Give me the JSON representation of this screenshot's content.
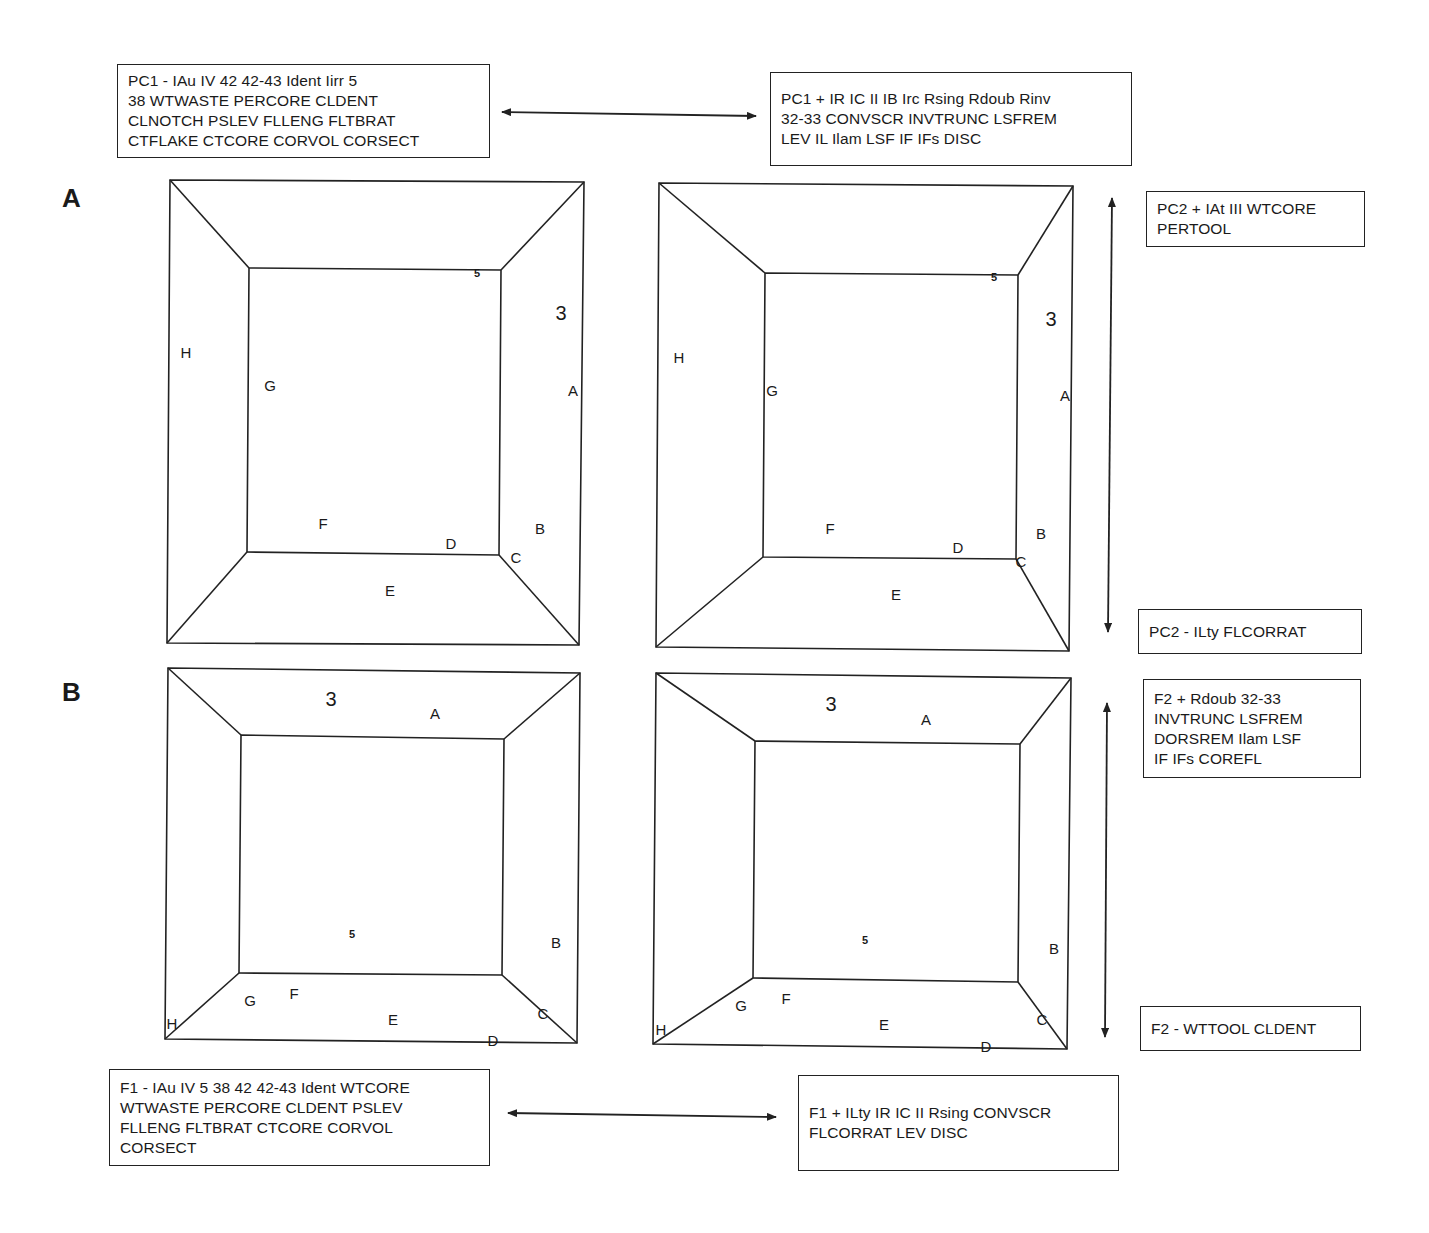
{
  "panels": [
    {
      "id": "A",
      "label": "A",
      "x": 62,
      "y": 198
    },
    {
      "id": "B",
      "label": "B",
      "x": 62,
      "y": 692
    }
  ],
  "text_boxes": [
    {
      "id": "pc1-minus",
      "x": 117,
      "y": 64,
      "w": 373,
      "h": 94,
      "lines": [
        "PC1 - IAu IV 42 42-43 Ident Iirr 5",
        "38 WTWASTE PERCORE CLDENT",
        "CLNOTCH PSLEV FLLENG FLTBRAT",
        "CTFLAKE CTCORE CORVOL CORSECT"
      ]
    },
    {
      "id": "pc1-plus",
      "x": 770,
      "y": 72,
      "w": 362,
      "h": 94,
      "lines": [
        "PC1 + IR IC II IB Irc Rsing Rdoub Rinv",
        "32-33 CONVSCR INVTRUNC LSFREM",
        "LEV IL Ilam LSF IF IFs DISC"
      ]
    },
    {
      "id": "pc2-plus",
      "x": 1146,
      "y": 191,
      "w": 219,
      "h": 56,
      "lines": [
        "PC2 + IAt III WTCORE",
        "PERTOOL"
      ]
    },
    {
      "id": "pc2-minus",
      "x": 1138,
      "y": 609,
      "w": 224,
      "h": 45,
      "lines": [
        "PC2 - ILty FLCORRAT"
      ]
    },
    {
      "id": "f2-plus",
      "x": 1143,
      "y": 679,
      "w": 218,
      "h": 99,
      "lines": [
        "F2 + Rdoub 32-33",
        "INVTRUNC LSFREM",
        "DORSREM Ilam LSF",
        "IF IFs COREFL"
      ]
    },
    {
      "id": "f2-minus",
      "x": 1140,
      "y": 1006,
      "w": 221,
      "h": 45,
      "lines": [
        "F2 - WTTOOL CLDENT"
      ]
    },
    {
      "id": "f1-minus",
      "x": 109,
      "y": 1069,
      "w": 381,
      "h": 97,
      "lines": [
        "F1 - IAu IV 5 38 42 42-43 Ident WTCORE",
        "WTWASTE PERCORE CLDENT PSLEV",
        "FLLENG FLTBRAT CTCORE CORVOL",
        "CORSECT"
      ]
    },
    {
      "id": "f1-plus",
      "x": 798,
      "y": 1075,
      "w": 321,
      "h": 96,
      "lines": [
        "F1 + ILty IR IC II Rsing CONVSCR",
        "FLCORRAT LEV DISC"
      ]
    }
  ],
  "arrows": [
    {
      "id": "pc1-axis",
      "x1": 502,
      "y1": 112,
      "x2": 756,
      "y2": 116
    },
    {
      "id": "pc2-axis",
      "x1": 1112,
      "y1": 198,
      "x2": 1108,
      "y2": 632
    },
    {
      "id": "f2-axis",
      "x1": 1107,
      "y1": 703,
      "x2": 1105,
      "y2": 1037
    },
    {
      "id": "f1-axis",
      "x1": 508,
      "y1": 1113,
      "x2": 776,
      "y2": 1117
    }
  ],
  "frames": [
    {
      "id": "A-left",
      "outer": [
        [
          170,
          180
        ],
        [
          584,
          182
        ],
        [
          579,
          645
        ],
        [
          167,
          643
        ]
      ],
      "inner": [
        [
          249,
          268
        ],
        [
          501,
          270
        ],
        [
          499,
          555
        ],
        [
          247,
          552
        ]
      ],
      "labels": [
        {
          "t": "5",
          "x": 477,
          "y": 273,
          "cls": "small"
        },
        {
          "t": "3",
          "x": 561,
          "y": 313,
          "cls": "big"
        },
        {
          "t": "H",
          "x": 186,
          "y": 352,
          "cls": ""
        },
        {
          "t": "G",
          "x": 270,
          "y": 385,
          "cls": ""
        },
        {
          "t": "A",
          "x": 573,
          "y": 390,
          "cls": ""
        },
        {
          "t": "F",
          "x": 323,
          "y": 523,
          "cls": ""
        },
        {
          "t": "B",
          "x": 540,
          "y": 528,
          "cls": ""
        },
        {
          "t": "D",
          "x": 451,
          "y": 543,
          "cls": ""
        },
        {
          "t": "C",
          "x": 516,
          "y": 557,
          "cls": ""
        },
        {
          "t": "E",
          "x": 390,
          "y": 590,
          "cls": ""
        }
      ]
    },
    {
      "id": "A-right",
      "outer": [
        [
          659,
          183
        ],
        [
          1073,
          186
        ],
        [
          1069,
          651
        ],
        [
          656,
          647
        ]
      ],
      "inner": [
        [
          765,
          273
        ],
        [
          1018,
          275
        ],
        [
          1016,
          559
        ],
        [
          763,
          557
        ]
      ],
      "labels": [
        {
          "t": "5",
          "x": 994,
          "y": 277,
          "cls": "small"
        },
        {
          "t": "3",
          "x": 1051,
          "y": 319,
          "cls": "big"
        },
        {
          "t": "H",
          "x": 679,
          "y": 357,
          "cls": ""
        },
        {
          "t": "G",
          "x": 772,
          "y": 390,
          "cls": ""
        },
        {
          "t": "A",
          "x": 1065,
          "y": 395,
          "cls": ""
        },
        {
          "t": "F",
          "x": 830,
          "y": 528,
          "cls": ""
        },
        {
          "t": "B",
          "x": 1041,
          "y": 533,
          "cls": ""
        },
        {
          "t": "D",
          "x": 958,
          "y": 547,
          "cls": ""
        },
        {
          "t": "C",
          "x": 1021,
          "y": 561,
          "cls": ""
        },
        {
          "t": "E",
          "x": 896,
          "y": 594,
          "cls": ""
        }
      ]
    },
    {
      "id": "B-left",
      "outer": [
        [
          168,
          668
        ],
        [
          580,
          673
        ],
        [
          577,
          1043
        ],
        [
          165,
          1039
        ]
      ],
      "inner": [
        [
          241,
          735
        ],
        [
          504,
          739
        ],
        [
          502,
          975
        ],
        [
          239,
          973
        ]
      ],
      "labels": [
        {
          "t": "3",
          "x": 331,
          "y": 699,
          "cls": "big"
        },
        {
          "t": "A",
          "x": 435,
          "y": 713,
          "cls": ""
        },
        {
          "t": "5",
          "x": 352,
          "y": 934,
          "cls": "small"
        },
        {
          "t": "B",
          "x": 556,
          "y": 942,
          "cls": ""
        },
        {
          "t": "G",
          "x": 250,
          "y": 1000,
          "cls": ""
        },
        {
          "t": "F",
          "x": 294,
          "y": 993,
          "cls": ""
        },
        {
          "t": "E",
          "x": 393,
          "y": 1019,
          "cls": ""
        },
        {
          "t": "C",
          "x": 543,
          "y": 1013,
          "cls": ""
        },
        {
          "t": "H",
          "x": 172,
          "y": 1023,
          "cls": ""
        },
        {
          "t": "D",
          "x": 493,
          "y": 1040,
          "cls": ""
        }
      ]
    },
    {
      "id": "B-right",
      "outer": [
        [
          656,
          673
        ],
        [
          1071,
          678
        ],
        [
          1067,
          1049
        ],
        [
          653,
          1044
        ]
      ],
      "inner": [
        [
          755,
          741
        ],
        [
          1020,
          744
        ],
        [
          1018,
          982
        ],
        [
          753,
          978
        ]
      ],
      "labels": [
        {
          "t": "3",
          "x": 831,
          "y": 704,
          "cls": "big"
        },
        {
          "t": "A",
          "x": 926,
          "y": 719,
          "cls": ""
        },
        {
          "t": "5",
          "x": 865,
          "y": 940,
          "cls": "small"
        },
        {
          "t": "B",
          "x": 1054,
          "y": 948,
          "cls": ""
        },
        {
          "t": "G",
          "x": 741,
          "y": 1005,
          "cls": ""
        },
        {
          "t": "F",
          "x": 786,
          "y": 998,
          "cls": ""
        },
        {
          "t": "E",
          "x": 884,
          "y": 1024,
          "cls": ""
        },
        {
          "t": "C",
          "x": 1042,
          "y": 1019,
          "cls": ""
        },
        {
          "t": "H",
          "x": 661,
          "y": 1029,
          "cls": ""
        },
        {
          "t": "D",
          "x": 986,
          "y": 1046,
          "cls": ""
        }
      ]
    }
  ],
  "colors": {
    "line": "#222222",
    "background": "#ffffff",
    "text": "#1a1a1a"
  }
}
